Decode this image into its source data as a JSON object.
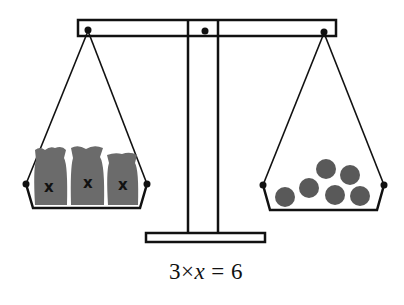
{
  "diagram": {
    "type": "balance-scale",
    "left_pan": {
      "items": [
        {
          "label": "x",
          "kind": "bag"
        },
        {
          "label": "x",
          "kind": "bag"
        },
        {
          "label": "x",
          "kind": "bag"
        }
      ]
    },
    "right_pan": {
      "count": 6,
      "kind": "ball"
    },
    "equation": {
      "coef": "3",
      "op": "×",
      "var": "x",
      "eq": "=",
      "rhs": "6"
    },
    "colors": {
      "stroke": "#111111",
      "bag": "#6b6b6b",
      "ball": "#595959",
      "background": "#ffffff"
    }
  }
}
